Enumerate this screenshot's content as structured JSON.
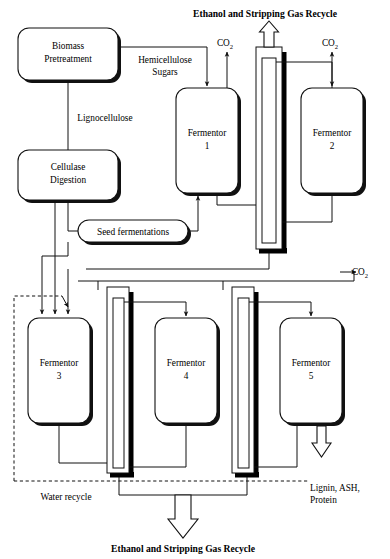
{
  "diagram": {
    "title_top": "Ethanol and Stripping Gas Recycle",
    "title_bottom": "Ethanol and Stripping Gas Recycle",
    "units": [
      {
        "id": "biomass-pretreatment",
        "line1": "Biomass",
        "line2": "Pretreatment"
      },
      {
        "id": "cellulase-digestion",
        "line1": "Cellulase",
        "line2": "Digestion"
      },
      {
        "id": "fermentor-1",
        "line1": "Fermentor",
        "line2": "1"
      },
      {
        "id": "fermentor-2",
        "line1": "Fermentor",
        "line2": "2"
      },
      {
        "id": "fermentor-3",
        "line1": "Fermentor",
        "line2": "3"
      },
      {
        "id": "fermentor-4",
        "line1": "Fermentor",
        "line2": "4"
      },
      {
        "id": "fermentor-5",
        "line1": "Fermentor",
        "line2": "5"
      }
    ],
    "seed_node": {
      "label": "Seed fermentations"
    },
    "streams": {
      "hemicellulose_line1": "Hemicellulose",
      "hemicellulose_line2": "Sugars",
      "lignocellulose": "Lignocellulose",
      "water_recycle": "Water recycle",
      "lignin_line1": "Lignin, ASH,",
      "lignin_line2": "Protein"
    },
    "gas_labels": {
      "co2_base": "CO",
      "co2_sub": "2"
    },
    "co2_vents": [
      {
        "id": "co2-fermentor-1"
      },
      {
        "id": "co2-fermentor-2"
      },
      {
        "id": "co2-bottom-bank"
      }
    ],
    "columns": [
      {
        "id": "stripping-column-top"
      },
      {
        "id": "stripping-column-left"
      },
      {
        "id": "stripping-column-right"
      }
    ],
    "colors": {
      "stroke": "#111111",
      "shadow": "#000000",
      "background": "#ffffff"
    }
  }
}
